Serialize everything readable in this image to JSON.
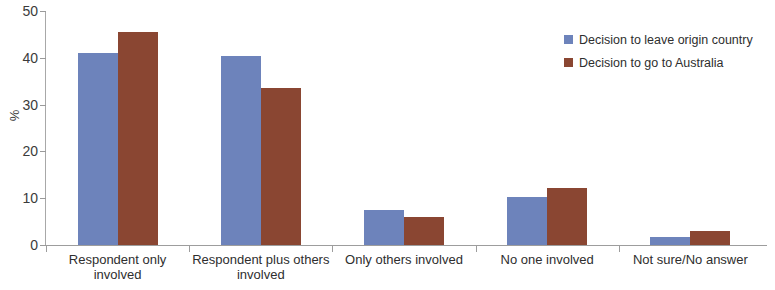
{
  "chart_data": {
    "type": "bar",
    "title": "",
    "subtitle": "",
    "xlabel": "",
    "ylabel": "%",
    "ylim": [
      0,
      50
    ],
    "ytick_labels": [
      "0",
      "10",
      "20",
      "30",
      "40",
      "50"
    ],
    "ytick_values": [
      0,
      10,
      20,
      30,
      40,
      50
    ],
    "grid": false,
    "legend_position": "top-right",
    "categories": [
      "Respondent only involved",
      "Respondent plus others involved",
      "Only others involved",
      "No one involved",
      "Not sure/No answer"
    ],
    "series": [
      {
        "name": "Decision to leave origin country",
        "color": "#6d83bb",
        "values": [
          41.0,
          40.3,
          7.5,
          10.2,
          1.8
        ]
      },
      {
        "name": "Decision to go to Australia",
        "color": "#8a4632",
        "values": [
          45.5,
          33.5,
          5.9,
          12.2,
          3.0
        ]
      }
    ]
  },
  "legend": {
    "items": [
      {
        "label": "Decision to leave origin country",
        "color": "#6d83bb"
      },
      {
        "label": "Decision to go to Australia",
        "color": "#8a4632"
      }
    ]
  },
  "colors": {
    "series_blue": "#6d83bb",
    "series_brown": "#8a4632",
    "axis": "#9d9d9d",
    "text": "#2e2e2e",
    "background": "#ffffff"
  }
}
